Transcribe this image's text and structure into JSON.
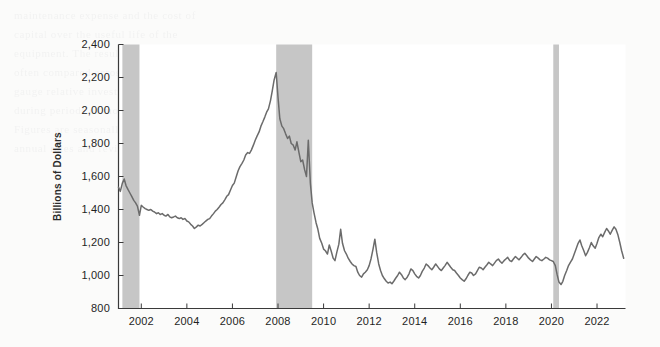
{
  "background_text": [
    "maintenance expense and the cost of",
    "capital over the useful life of the",
    "equipment. The resulting measure is",
    "often compared across industries to",
    "gauge relative investment intensity",
    "during periods of monetary easing.",
    "Figures are seasonally adjusted at",
    "annual rates and revised quarterly."
  ],
  "chart_data": {
    "type": "line",
    "title": "",
    "xlabel": "",
    "ylabel": "Billions of Dollars",
    "xlim": [
      2001.0,
      2023.25
    ],
    "ylim": [
      800,
      2400
    ],
    "ytick_values": [
      800,
      1000,
      1200,
      1400,
      1600,
      1800,
      2000,
      2200,
      2400
    ],
    "ytick_labels": [
      "800",
      "1,000",
      "1,200",
      "1,400",
      "1,600",
      "1,800",
      "2,000",
      "2,200",
      "2,400"
    ],
    "xtick_values": [
      2002,
      2004,
      2006,
      2008,
      2010,
      2012,
      2014,
      2016,
      2018,
      2020,
      2022
    ],
    "xtick_labels": [
      "2002",
      "2004",
      "2006",
      "2008",
      "2010",
      "2012",
      "2014",
      "2016",
      "2018",
      "2020",
      "2022"
    ],
    "grid": false,
    "legend": false,
    "line_color": "#6b6b6b",
    "recession_color": "#c6c6c6",
    "axis_color": "#3a3a3a",
    "plot_background": "#ffffff",
    "recessions": [
      {
        "label": "2001 recession",
        "start": 2001.17,
        "end": 2001.92
      },
      {
        "label": "Great Recession",
        "start": 2007.92,
        "end": 2009.5
      },
      {
        "label": "COVID-19 recession",
        "start": 2020.08,
        "end": 2020.33
      }
    ],
    "series": [
      {
        "name": "Value",
        "x": [
          2001.0,
          2001.08,
          2001.17,
          2001.25,
          2001.33,
          2001.42,
          2001.5,
          2001.58,
          2001.67,
          2001.75,
          2001.83,
          2001.92,
          2002.0,
          2002.08,
          2002.17,
          2002.25,
          2002.33,
          2002.42,
          2002.5,
          2002.58,
          2002.67,
          2002.75,
          2002.83,
          2002.92,
          2003.0,
          2003.08,
          2003.17,
          2003.25,
          2003.33,
          2003.42,
          2003.5,
          2003.58,
          2003.67,
          2003.75,
          2003.83,
          2003.92,
          2004.0,
          2004.08,
          2004.17,
          2004.25,
          2004.33,
          2004.42,
          2004.5,
          2004.58,
          2004.67,
          2004.75,
          2004.83,
          2004.92,
          2005.0,
          2005.08,
          2005.17,
          2005.25,
          2005.33,
          2005.42,
          2005.5,
          2005.58,
          2005.67,
          2005.75,
          2005.83,
          2005.92,
          2006.0,
          2006.08,
          2006.17,
          2006.25,
          2006.33,
          2006.42,
          2006.5,
          2006.58,
          2006.67,
          2006.75,
          2006.83,
          2006.92,
          2007.0,
          2007.08,
          2007.17,
          2007.25,
          2007.33,
          2007.42,
          2007.5,
          2007.58,
          2007.67,
          2007.75,
          2007.83,
          2007.92,
          2008.0,
          2008.08,
          2008.17,
          2008.25,
          2008.33,
          2008.42,
          2008.5,
          2008.58,
          2008.67,
          2008.75,
          2008.83,
          2008.92,
          2009.0,
          2009.08,
          2009.17,
          2009.25,
          2009.33,
          2009.42,
          2009.5,
          2009.58,
          2009.67,
          2009.75,
          2009.83,
          2009.92,
          2010.0,
          2010.08,
          2010.17,
          2010.25,
          2010.33,
          2010.42,
          2010.5,
          2010.58,
          2010.67,
          2010.75,
          2010.83,
          2010.92,
          2011.0,
          2011.08,
          2011.17,
          2011.25,
          2011.33,
          2011.42,
          2011.5,
          2011.58,
          2011.67,
          2011.75,
          2011.83,
          2011.92,
          2012.0,
          2012.08,
          2012.17,
          2012.25,
          2012.33,
          2012.42,
          2012.5,
          2012.58,
          2012.67,
          2012.75,
          2012.83,
          2012.92,
          2013.0,
          2013.08,
          2013.17,
          2013.25,
          2013.33,
          2013.42,
          2013.5,
          2013.58,
          2013.67,
          2013.75,
          2013.83,
          2013.92,
          2014.0,
          2014.08,
          2014.17,
          2014.25,
          2014.33,
          2014.42,
          2014.5,
          2014.58,
          2014.67,
          2014.75,
          2014.83,
          2014.92,
          2015.0,
          2015.08,
          2015.17,
          2015.25,
          2015.33,
          2015.42,
          2015.5,
          2015.58,
          2015.67,
          2015.75,
          2015.83,
          2015.92,
          2016.0,
          2016.08,
          2016.17,
          2016.25,
          2016.33,
          2016.42,
          2016.5,
          2016.58,
          2016.67,
          2016.75,
          2016.83,
          2016.92,
          2017.0,
          2017.08,
          2017.17,
          2017.25,
          2017.33,
          2017.42,
          2017.5,
          2017.58,
          2017.67,
          2017.75,
          2017.83,
          2017.92,
          2018.0,
          2018.08,
          2018.17,
          2018.25,
          2018.33,
          2018.42,
          2018.5,
          2018.58,
          2018.67,
          2018.75,
          2018.83,
          2018.92,
          2019.0,
          2019.08,
          2019.17,
          2019.25,
          2019.33,
          2019.42,
          2019.5,
          2019.58,
          2019.67,
          2019.75,
          2019.83,
          2019.92,
          2020.0,
          2020.08,
          2020.17,
          2020.25,
          2020.33,
          2020.42,
          2020.5,
          2020.58,
          2020.67,
          2020.75,
          2020.83,
          2020.92,
          2021.0,
          2021.08,
          2021.17,
          2021.25,
          2021.33,
          2021.42,
          2021.5,
          2021.58,
          2021.67,
          2021.75,
          2021.83,
          2021.92,
          2022.0,
          2022.08,
          2022.17,
          2022.25,
          2022.33,
          2022.42,
          2022.5,
          2022.58,
          2022.67,
          2022.75,
          2022.83,
          2022.92,
          2023.0,
          2023.08,
          2023.17
        ],
        "values": [
          1535,
          1510,
          1560,
          1585,
          1545,
          1520,
          1500,
          1480,
          1455,
          1440,
          1420,
          1365,
          1425,
          1415,
          1405,
          1400,
          1395,
          1400,
          1390,
          1385,
          1375,
          1380,
          1370,
          1375,
          1365,
          1360,
          1370,
          1355,
          1350,
          1355,
          1360,
          1350,
          1345,
          1350,
          1340,
          1345,
          1330,
          1325,
          1310,
          1300,
          1285,
          1295,
          1305,
          1300,
          1310,
          1320,
          1330,
          1340,
          1345,
          1360,
          1375,
          1390,
          1400,
          1415,
          1430,
          1440,
          1460,
          1480,
          1490,
          1520,
          1545,
          1560,
          1600,
          1635,
          1660,
          1680,
          1700,
          1730,
          1745,
          1740,
          1760,
          1790,
          1820,
          1845,
          1870,
          1905,
          1930,
          1960,
          1990,
          2010,
          2060,
          2120,
          2185,
          2230,
          2080,
          1950,
          1905,
          1890,
          1860,
          1830,
          1845,
          1800,
          1790,
          1760,
          1810,
          1745,
          1690,
          1700,
          1640,
          1600,
          1820,
          1560,
          1440,
          1380,
          1320,
          1280,
          1225,
          1195,
          1160,
          1150,
          1130,
          1185,
          1150,
          1105,
          1090,
          1140,
          1190,
          1280,
          1195,
          1150,
          1130,
          1105,
          1085,
          1070,
          1060,
          1055,
          1020,
          1000,
          990,
          1010,
          1020,
          1035,
          1060,
          1100,
          1160,
          1220,
          1140,
          1070,
          1030,
          1000,
          980,
          965,
          955,
          960,
          950,
          965,
          985,
          1000,
          1020,
          1005,
          985,
          975,
          990,
          1010,
          1040,
          1030,
          1010,
          995,
          985,
          1000,
          1025,
          1045,
          1070,
          1060,
          1045,
          1035,
          1050,
          1070,
          1055,
          1040,
          1030,
          1045,
          1060,
          1080,
          1065,
          1050,
          1035,
          1030,
          1015,
          1000,
          985,
          975,
          965,
          980,
          1000,
          1020,
          1015,
          1000,
          1010,
          1030,
          1050,
          1045,
          1035,
          1050,
          1065,
          1080,
          1070,
          1060,
          1075,
          1090,
          1100,
          1085,
          1075,
          1090,
          1100,
          1110,
          1090,
          1085,
          1100,
          1115,
          1105,
          1095,
          1110,
          1125,
          1135,
          1120,
          1105,
          1095,
          1085,
          1100,
          1115,
          1105,
          1095,
          1090,
          1100,
          1110,
          1105,
          1095,
          1090,
          1085,
          1060,
          1005,
          960,
          945,
          965,
          1000,
          1030,
          1060,
          1080,
          1100,
          1130,
          1160,
          1195,
          1215,
          1180,
          1150,
          1120,
          1140,
          1170,
          1200,
          1180,
          1165,
          1195,
          1230,
          1250,
          1235,
          1260,
          1285,
          1270,
          1250,
          1275,
          1295,
          1280,
          1245,
          1200,
          1150,
          1105
        ]
      }
    ]
  }
}
